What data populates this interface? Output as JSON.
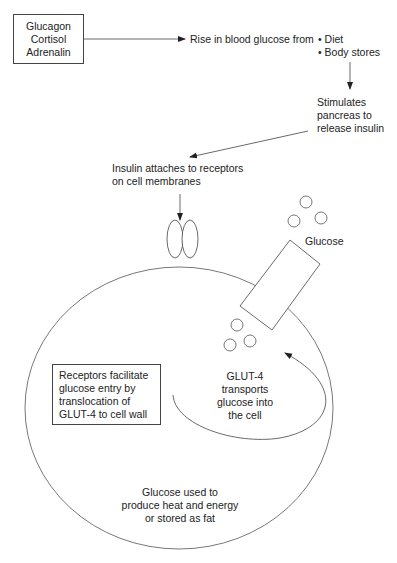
{
  "hormone_box": {
    "lines": [
      "Glucagon",
      "Cortisol",
      "Adrenalin"
    ]
  },
  "rise_text": "Rise in blood glucose from",
  "sources": [
    "• Diet",
    "• Body stores"
  ],
  "pancreas": {
    "lines": [
      "Stimulates",
      "pancreas to",
      "release insulin"
    ]
  },
  "insulin": {
    "lines": [
      "Insulin attaches to receptors",
      "on cell membranes"
    ]
  },
  "glucose_label": "Glucose",
  "receptors_box": {
    "lines": [
      "Receptors facilitate",
      "glucose entry by",
      "translocation of",
      "GLUT-4 to cell wall"
    ]
  },
  "glut4": {
    "lines": [
      "GLUT-4",
      "transports",
      "glucose into",
      "the cell"
    ]
  },
  "outcome": {
    "lines": [
      "Glucose used to",
      "produce heat and energy",
      "or stored as fat"
    ]
  },
  "colors": {
    "line": "#444444",
    "text": "#222222",
    "background": "#ffffff"
  }
}
